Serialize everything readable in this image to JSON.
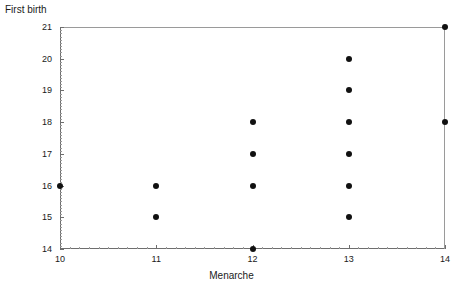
{
  "chart_data": {
    "type": "scatter",
    "title": "",
    "xlabel": "Menarche",
    "ylabel": "First birth",
    "xlim": [
      10,
      14
    ],
    "ylim": [
      14,
      21
    ],
    "xticks": [
      10,
      11,
      12,
      13,
      14
    ],
    "yticks": [
      14,
      15,
      16,
      17,
      18,
      19,
      20,
      21
    ],
    "xtick_labels": [
      "10",
      "11",
      "12",
      "13",
      "14"
    ],
    "ytick_labels": [
      "14",
      "15",
      "16",
      "17",
      "18",
      "19",
      "20",
      "21"
    ],
    "minor_ticks_per_interval": 10,
    "grid": false,
    "legend": null,
    "marker": "filled-circle",
    "marker_color": "#111111",
    "background_color": "#ffffff",
    "axis_color": "#6e6e6e",
    "points": [
      {
        "x": 10,
        "y": 16
      },
      {
        "x": 11,
        "y": 15
      },
      {
        "x": 11,
        "y": 16
      },
      {
        "x": 12,
        "y": 14
      },
      {
        "x": 12,
        "y": 16
      },
      {
        "x": 12,
        "y": 17
      },
      {
        "x": 12,
        "y": 18
      },
      {
        "x": 13,
        "y": 15
      },
      {
        "x": 13,
        "y": 16
      },
      {
        "x": 13,
        "y": 17
      },
      {
        "x": 13,
        "y": 18
      },
      {
        "x": 13,
        "y": 19
      },
      {
        "x": 13,
        "y": 20
      },
      {
        "x": 14,
        "y": 18
      },
      {
        "x": 14,
        "y": 21
      }
    ],
    "n_points": 15
  }
}
